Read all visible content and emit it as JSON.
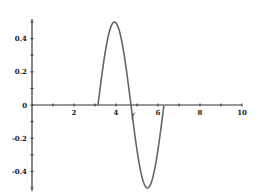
{
  "chart_data": {
    "type": "line",
    "title": "",
    "xlabel": "",
    "ylabel": "",
    "xlim": [
      0,
      10
    ],
    "ylim": [
      -0.5,
      0.5
    ],
    "grid": false,
    "legend": null,
    "x_ticks": [
      2,
      4,
      6,
      8,
      10
    ],
    "x_tick_labels": [
      "2",
      "4",
      "6",
      "8",
      "10"
    ],
    "y_ticks": [
      0.4,
      0.2,
      0,
      -0.2,
      -0.4
    ],
    "y_tick_labels": [
      "0.4",
      "0.2",
      "0",
      "-0.2",
      "-0.4"
    ],
    "annotations": [
      {
        "text": "f",
        "x": 4.75,
        "y": -0.06
      }
    ],
    "series": [
      {
        "name": "f",
        "color": "#666666",
        "description": "0.5*sin(2x) for pi<=x<=2pi, 0 elsewhere",
        "x": [
          3.14,
          3.34,
          3.54,
          3.73,
          3.93,
          4.12,
          4.32,
          4.52,
          4.71,
          4.91,
          5.11,
          5.3,
          5.5,
          5.69,
          5.89,
          6.09,
          6.28
        ],
        "y": [
          0.0,
          0.19,
          0.35,
          0.46,
          0.5,
          0.46,
          0.35,
          0.19,
          0.0,
          -0.19,
          -0.35,
          -0.46,
          -0.5,
          -0.46,
          -0.35,
          -0.19,
          0.0
        ]
      }
    ]
  }
}
